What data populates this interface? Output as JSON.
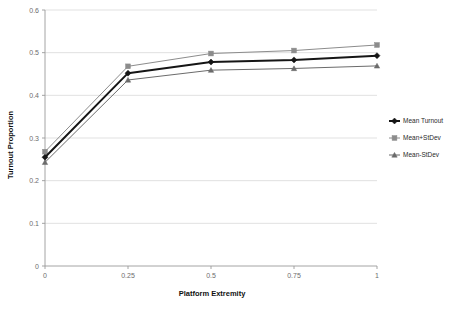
{
  "chart_data": {
    "type": "line",
    "title": "",
    "xlabel": "Platform Extremity",
    "ylabel": "Turnout Proportion",
    "x": [
      0,
      0.25,
      0.5,
      0.75,
      1
    ],
    "xtick_labels": [
      "0",
      "0.25",
      "0.5",
      "0.75",
      "1"
    ],
    "ytick_labels": [
      "0",
      "0.1",
      "0.2",
      "0.3",
      "0.4",
      "0.5",
      "0.6"
    ],
    "ytick_values": [
      0,
      0.1,
      0.2,
      0.3,
      0.4,
      0.5,
      0.6
    ],
    "xlim": [
      0,
      1
    ],
    "ylim": [
      0,
      0.6
    ],
    "grid": "horizontal",
    "legend_position": "right",
    "series": [
      {
        "name": "Mean Turnout",
        "values": [
          0.255,
          0.452,
          0.478,
          0.483,
          0.493
        ],
        "color": "#151515",
        "marker": "diamond",
        "line_width": 2.0
      },
      {
        "name": "Mean+StDev",
        "values": [
          0.268,
          0.468,
          0.498,
          0.505,
          0.518
        ],
        "color": "#8c8c8c",
        "marker": "square",
        "line_width": 1.0
      },
      {
        "name": "Mean-StDev",
        "values": [
          0.243,
          0.436,
          0.459,
          0.463,
          0.469
        ],
        "color": "#6b6b6b",
        "marker": "triangle",
        "line_width": 1.0
      }
    ]
  },
  "legend": {
    "items": [
      {
        "label": "Mean Turnout"
      },
      {
        "label": "Mean+StDev"
      },
      {
        "label": "Mean-StDev"
      }
    ]
  },
  "axes": {
    "x_title": "Platform Extremity",
    "y_title": "Turnout Proportion"
  }
}
